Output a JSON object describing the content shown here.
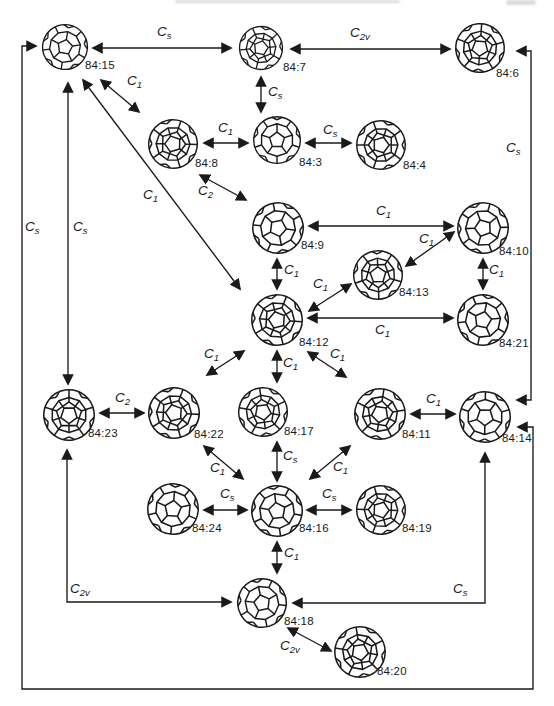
{
  "page": {
    "background": "#ffffff",
    "ink": "#1a1a1a"
  },
  "diagram": {
    "nodes": [
      {
        "id": "84:15",
        "label": "84:15",
        "x": 65,
        "y": 47,
        "r": 24,
        "lx": 85,
        "ly": 60,
        "rot": 10,
        "style": "plain"
      },
      {
        "id": "84:7",
        "label": "84:7",
        "x": 261,
        "y": 48,
        "r": 23,
        "lx": 283,
        "ly": 62,
        "rot": 85,
        "style": "dense"
      },
      {
        "id": "84:6",
        "label": "84:6",
        "x": 480,
        "y": 48,
        "r": 26,
        "lx": 496,
        "ly": 68,
        "rot": 40,
        "style": "dense"
      },
      {
        "id": "84:8",
        "label": "84:8",
        "x": 173,
        "y": 144,
        "r": 26,
        "lx": 195,
        "ly": 158,
        "rot": 55,
        "style": "dense"
      },
      {
        "id": "84:3",
        "label": "84:3",
        "x": 277,
        "y": 140,
        "r": 25,
        "lx": 299,
        "ly": 157,
        "rot": 0,
        "style": "plain"
      },
      {
        "id": "84:4",
        "label": "84:4",
        "x": 381,
        "y": 145,
        "r": 26,
        "lx": 403,
        "ly": 160,
        "rot": 90,
        "style": "dense"
      },
      {
        "id": "84:9",
        "label": "84:9",
        "x": 278,
        "y": 228,
        "r": 27,
        "lx": 301,
        "ly": 240,
        "rot": 25,
        "style": "plain"
      },
      {
        "id": "84:13",
        "label": "84:13",
        "x": 378,
        "y": 275,
        "r": 26,
        "lx": 399,
        "ly": 287,
        "rot": 70,
        "style": "dense"
      },
      {
        "id": "84:10",
        "label": "84:10",
        "x": 483,
        "y": 228,
        "r": 27,
        "lx": 499,
        "ly": 246,
        "rot": -20,
        "style": "plain"
      },
      {
        "id": "84:12",
        "label": "84:12",
        "x": 277,
        "y": 320,
        "r": 27,
        "lx": 299,
        "ly": 337,
        "rot": 130,
        "style": "dense"
      },
      {
        "id": "84:21",
        "label": "84:21",
        "x": 483,
        "y": 320,
        "r": 27,
        "lx": 499,
        "ly": 338,
        "rot": -60,
        "style": "plain"
      },
      {
        "id": "84:23",
        "label": "84:23",
        "x": 69,
        "y": 415,
        "r": 27,
        "lx": 88,
        "ly": 428,
        "rot": 36,
        "style": "dense"
      },
      {
        "id": "84:22",
        "label": "84:22",
        "x": 174,
        "y": 413,
        "r": 27,
        "lx": 194,
        "ly": 429,
        "rot": -15,
        "style": "dense"
      },
      {
        "id": "84:17",
        "label": "84:17",
        "x": 263,
        "y": 412,
        "r": 26,
        "lx": 284,
        "ly": 426,
        "rot": 100,
        "style": "dense"
      },
      {
        "id": "84:11",
        "label": "84:11",
        "x": 380,
        "y": 414,
        "r": 27,
        "lx": 402,
        "ly": 429,
        "rot": 45,
        "style": "dense"
      },
      {
        "id": "84:14",
        "label": "84:14",
        "x": 485,
        "y": 417,
        "r": 27,
        "lx": 502,
        "ly": 433,
        "rot": -35,
        "style": "plain"
      },
      {
        "id": "84:24",
        "label": "84:24",
        "x": 173,
        "y": 509,
        "r": 27,
        "lx": 192,
        "ly": 523,
        "rot": 5,
        "style": "plain"
      },
      {
        "id": "84:16",
        "label": "84:16",
        "x": 277,
        "y": 511,
        "r": 27,
        "lx": 299,
        "ly": 523,
        "rot": -80,
        "style": "plain"
      },
      {
        "id": "84:19",
        "label": "84:19",
        "x": 381,
        "y": 510,
        "r": 26,
        "lx": 402,
        "ly": 523,
        "rot": 20,
        "style": "dense"
      },
      {
        "id": "84:18",
        "label": "84:18",
        "x": 262,
        "y": 603,
        "r": 26,
        "lx": 284,
        "ly": 616,
        "rot": 60,
        "style": "plain"
      },
      {
        "id": "84:20",
        "label": "84:20",
        "x": 360,
        "y": 652,
        "r": 27,
        "lx": 377,
        "ly": 666,
        "rot": -45,
        "style": "dense"
      }
    ],
    "edges": [
      {
        "from": "84:15",
        "to": "84:7",
        "base": "C",
        "sub": "s",
        "points": [
          [
            93,
            48
          ],
          [
            231,
            48
          ]
        ],
        "lx": 157,
        "ly": 25
      },
      {
        "from": "84:7",
        "to": "84:6",
        "base": "C",
        "sub": "2v",
        "points": [
          [
            291,
            49
          ],
          [
            450,
            49
          ]
        ],
        "lx": 350,
        "ly": 26
      },
      {
        "from": "84:7",
        "to": "84:3",
        "base": "C",
        "sub": "s",
        "points": [
          [
            261,
            77
          ],
          [
            261,
            112
          ]
        ],
        "lx": 268,
        "ly": 85
      },
      {
        "from": "84:8",
        "to": "84:3",
        "base": "C",
        "sub": "1",
        "points": [
          [
            204,
            143
          ],
          [
            248,
            143
          ]
        ],
        "lx": 218,
        "ly": 121
      },
      {
        "from": "84:3",
        "to": "84:4",
        "base": "C",
        "sub": "s",
        "points": [
          [
            306,
            143
          ],
          [
            351,
            143
          ]
        ],
        "lx": 323,
        "ly": 123
      },
      {
        "from": "84:15",
        "to": "84:8",
        "base": "C",
        "sub": "1",
        "points": [
          [
            101,
            80
          ],
          [
            139,
            112
          ]
        ],
        "lx": 127,
        "ly": 74
      },
      {
        "from": "84:15",
        "to": "84:12",
        "base": "C",
        "sub": "1",
        "points": [
          [
            83,
            80
          ],
          [
            240,
            289
          ]
        ],
        "lx": 143,
        "ly": 188
      },
      {
        "from": "84:15",
        "to": "84:23",
        "base": "C",
        "sub": "s",
        "points": [
          [
            68,
            83
          ],
          [
            68,
            384
          ]
        ],
        "lx": 73,
        "ly": 220
      },
      {
        "from": "84:15",
        "to": "84:14",
        "base": "C",
        "sub": "s",
        "points": [
          [
            36,
            46
          ],
          [
            22,
            46
          ],
          [
            22,
            689
          ],
          [
            533,
            689
          ],
          [
            533,
            427
          ],
          [
            518,
            427
          ]
        ],
        "lx": 25,
        "ly": 220
      },
      {
        "from": "84:6",
        "to": "84:14",
        "base": "C",
        "sub": "s",
        "points": [
          [
            517,
            51
          ],
          [
            531,
            51
          ],
          [
            531,
            400
          ],
          [
            517,
            400
          ]
        ],
        "lx": 506,
        "ly": 141
      },
      {
        "from": "84:8",
        "to": "84:9",
        "base": "C",
        "sub": "2",
        "points": [
          [
            200,
            175
          ],
          [
            246,
            200
          ]
        ],
        "lx": 198,
        "ly": 184
      },
      {
        "from": "84:9",
        "to": "84:10",
        "base": "C",
        "sub": "1",
        "points": [
          [
            309,
            226
          ],
          [
            453,
            226
          ]
        ],
        "lx": 376,
        "ly": 204
      },
      {
        "from": "84:13",
        "to": "84:10",
        "base": "C",
        "sub": "1",
        "points": [
          [
            406,
            266
          ],
          [
            454,
            232
          ]
        ],
        "lx": 419,
        "ly": 232
      },
      {
        "from": "84:9",
        "to": "84:12",
        "base": "C",
        "sub": "1",
        "points": [
          [
            277,
            259
          ],
          [
            277,
            289
          ]
        ],
        "lx": 284,
        "ly": 263
      },
      {
        "from": "84:12",
        "to": "84:13",
        "base": "C",
        "sub": "1",
        "points": [
          [
            309,
            311
          ],
          [
            351,
            284
          ]
        ],
        "lx": 313,
        "ly": 277
      },
      {
        "from": "84:12",
        "to": "84:21",
        "base": "C",
        "sub": "1",
        "points": [
          [
            308,
            318
          ],
          [
            453,
            318
          ]
        ],
        "lx": 375,
        "ly": 323
      },
      {
        "from": "84:10",
        "to": "84:21",
        "base": "C",
        "sub": "1",
        "points": [
          [
            483,
            259
          ],
          [
            483,
            289
          ]
        ],
        "lx": 489,
        "ly": 263
      },
      {
        "from": "84:12",
        "to": "84:22",
        "base": "C",
        "sub": "1",
        "points": [
          [
            244,
            351
          ],
          [
            207,
            375
          ]
        ],
        "lx": 204,
        "ly": 347
      },
      {
        "from": "84:12",
        "to": "84:17",
        "base": "C",
        "sub": "1",
        "points": [
          [
            277,
            351
          ],
          [
            277,
            382
          ]
        ],
        "lx": 283,
        "ly": 356
      },
      {
        "from": "84:12",
        "to": "84:11",
        "base": "C",
        "sub": "1",
        "points": [
          [
            308,
            352
          ],
          [
            346,
            377
          ]
        ],
        "lx": 330,
        "ly": 347
      },
      {
        "from": "84:23",
        "to": "84:22",
        "base": "C",
        "sub": "2",
        "points": [
          [
            100,
            413
          ],
          [
            144,
            413
          ]
        ],
        "lx": 115,
        "ly": 391
      },
      {
        "from": "84:11",
        "to": "84:14",
        "base": "C",
        "sub": "1",
        "points": [
          [
            411,
            414
          ],
          [
            455,
            414
          ]
        ],
        "lx": 426,
        "ly": 392
      },
      {
        "from": "84:22",
        "to": "84:16",
        "base": "C",
        "sub": "1",
        "points": [
          [
            204,
            446
          ],
          [
            243,
            479
          ]
        ],
        "lx": 210,
        "ly": 461
      },
      {
        "from": "84:17",
        "to": "84:16",
        "base": "C",
        "sub": "s",
        "points": [
          [
            277,
            442
          ],
          [
            277,
            481
          ]
        ],
        "lx": 283,
        "ly": 449
      },
      {
        "from": "84:11",
        "to": "84:16",
        "base": "C",
        "sub": "1",
        "points": [
          [
            350,
            446
          ],
          [
            310,
            479
          ]
        ],
        "lx": 333,
        "ly": 460
      },
      {
        "from": "84:24",
        "to": "84:16",
        "base": "C",
        "sub": "s",
        "points": [
          [
            204,
            510
          ],
          [
            247,
            510
          ]
        ],
        "lx": 220,
        "ly": 487
      },
      {
        "from": "84:16",
        "to": "84:19",
        "base": "C",
        "sub": "s",
        "points": [
          [
            307,
            510
          ],
          [
            351,
            510
          ]
        ],
        "lx": 322,
        "ly": 487
      },
      {
        "from": "84:16",
        "to": "84:18",
        "base": "C",
        "sub": "1",
        "points": [
          [
            277,
            542
          ],
          [
            277,
            573
          ]
        ],
        "lx": 284,
        "ly": 546
      },
      {
        "from": "84:23",
        "to": "84:18",
        "base": "C",
        "sub": "2v",
        "points": [
          [
            67,
            450
          ],
          [
            67,
            602
          ],
          [
            231,
            602
          ]
        ],
        "lx": 70,
        "ly": 582
      },
      {
        "from": "84:18",
        "to": "84:14",
        "base": "C",
        "sub": "s",
        "points": [
          [
            293,
            603
          ],
          [
            485,
            603
          ],
          [
            485,
            453
          ]
        ],
        "lx": 453,
        "ly": 582
      },
      {
        "from": "84:18",
        "to": "84:20",
        "base": "C",
        "sub": "2v",
        "points": [
          [
            288,
            628
          ],
          [
            331,
            651
          ]
        ],
        "lx": 280,
        "ly": 639
      }
    ]
  }
}
